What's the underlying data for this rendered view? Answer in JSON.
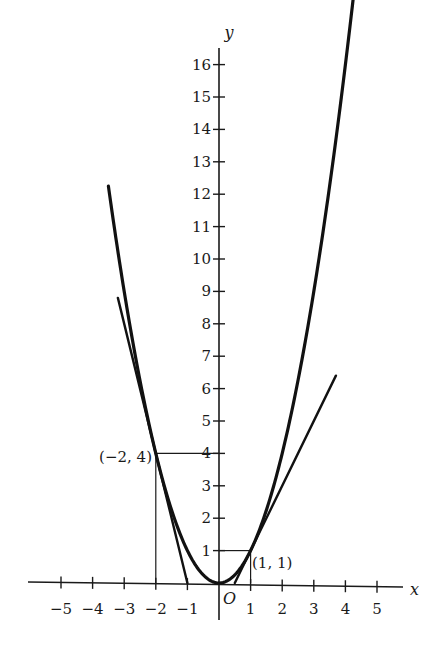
{
  "chart_data": {
    "type": "line",
    "title": "",
    "xlabel": "x",
    "ylabel": "y",
    "origin_label": "O",
    "xlim": [
      -5.5,
      5.8
    ],
    "ylim": [
      -1,
      16.8
    ],
    "grid": false,
    "x_ticks": [
      -5,
      -4,
      -3,
      -2,
      -1,
      1,
      2,
      3,
      4,
      5
    ],
    "x_tick_labels": [
      "−5",
      "−4",
      "−3",
      "−2",
      "−1",
      "1",
      "2",
      "3",
      "4",
      "5"
    ],
    "y_ticks": [
      1,
      2,
      3,
      4,
      5,
      6,
      7,
      8,
      9,
      10,
      11,
      12,
      13,
      14,
      15,
      16
    ],
    "y_tick_labels": [
      "1",
      "2",
      "3",
      "4",
      "5",
      "6",
      "7",
      "8",
      "9",
      "10",
      "11",
      "12",
      "13",
      "14",
      "15",
      "16"
    ],
    "series": [
      {
        "name": "parabola",
        "equation": "y = x^2",
        "x_range": [
          -3.5,
          4.3
        ]
      },
      {
        "name": "tangent at (-2, 4)",
        "equation": "y = -4x - 4",
        "x_range": [
          -3.2,
          -1
        ]
      },
      {
        "name": "tangent at (1, 1)",
        "equation": "y = 2x - 1",
        "x_range": [
          0.5,
          3.7
        ]
      }
    ],
    "annotations": [
      {
        "label": "(−2, 4)",
        "x": -2,
        "y": 4
      },
      {
        "label": "(1, 1)",
        "x": 1,
        "y": 1
      }
    ]
  }
}
